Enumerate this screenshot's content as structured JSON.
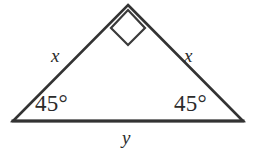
{
  "figure": {
    "shape": "triangle",
    "background_color": "#ffffff",
    "stroke_color": "#333333",
    "stroke_width": 2.5,
    "canvas": {
      "width": 257,
      "height": 159
    },
    "vertices": {
      "apex": {
        "x": 128,
        "y": 5
      },
      "bottom_left": {
        "x": 13,
        "y": 121
      },
      "bottom_right": {
        "x": 243,
        "y": 121
      }
    },
    "right_angle_marker": {
      "name": "right-angle-square",
      "vertex": "apex",
      "points": "128,10 145,28 128,45 111,28",
      "size": 24
    },
    "labels": {
      "leg_left": "x",
      "leg_right": "x",
      "base": "y",
      "angle_left": "45°",
      "angle_right": "45°"
    }
  }
}
